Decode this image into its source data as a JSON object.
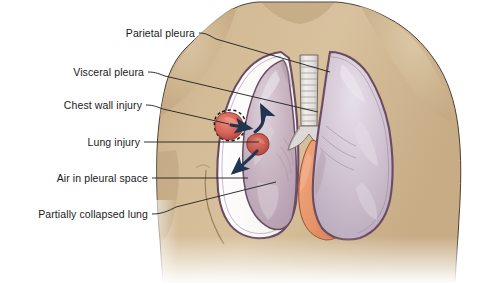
{
  "illustration": {
    "title": "Pneumothorax - partially collapsed lung with chest wall and lung injury",
    "canvas": {
      "width": 493,
      "height": 284
    },
    "background_color": "#ffffff",
    "colors": {
      "skin": "#cfb68f",
      "skin_shadow": "#b59b74",
      "skin_highlight": "#ddc8a6",
      "pleura_outline": "#6b4c63",
      "lung_tissue": "#cbbccb",
      "lung_tissue_light": "#e5dde6",
      "collapsed_lung": "#c4aebb",
      "air_space": "#fdfcfb",
      "heart": "#e8956b",
      "heart_shadow": "#d87f55",
      "trachea": "#e9e6e4",
      "trachea_ring": "#b8b0ac",
      "wound_red": "#d9665a",
      "wound_red_dark": "#a8362e",
      "arrow_navy": "#1f3550",
      "leader_line": "#262626",
      "label_text": "#1a1a1a"
    }
  },
  "labels": [
    {
      "id": "parietal-pleura",
      "text": "Parietal pleura",
      "text_anchor_x": 195,
      "text_anchor_y": 33,
      "leader": "M 199 33 C 207 33 210 36 216 39 L 330 72"
    },
    {
      "id": "visceral-pleura",
      "text": "Visceral pleura",
      "text_anchor_x": 144,
      "text_anchor_y": 72,
      "leader": "M 148 72 C 156 72 159 74 165 76 L 318 112"
    },
    {
      "id": "chest-wall-injury",
      "text": "Chest wall injury",
      "text_anchor_x": 142,
      "text_anchor_y": 105,
      "leader": "M 146 105 C 154 105 157 107 163 109 L 229 124"
    },
    {
      "id": "lung-injury",
      "text": "Lung injury",
      "text_anchor_x": 140,
      "text_anchor_y": 142,
      "leader": "M 144 142 L 259 142"
    },
    {
      "id": "air-in-pleural-space",
      "text": "Air in pleural space",
      "text_anchor_x": 148,
      "text_anchor_y": 178,
      "leader": "M 152 178 L 248 178"
    },
    {
      "id": "partially-collapsed-lung",
      "text": "Partially collapsed lung",
      "text_anchor_x": 148,
      "text_anchor_y": 214,
      "leader": "M 152 214 C 162 214 168 211 176 207 L 276 182"
    }
  ],
  "anatomy": {
    "torso": {
      "name": "upper torso and shoulders",
      "fill": "#cfb68f"
    },
    "left_pleural_cavity": {
      "name": "pneumothorax cavity with free air",
      "fill": "#fdfcfb"
    },
    "left_lung": {
      "name": "partially collapsed left lung",
      "fill": "#c4aebb"
    },
    "right_lung": {
      "name": "normally inflated right lung",
      "fill": "#cbbccb"
    },
    "heart": {
      "name": "heart",
      "fill": "#e8956b"
    },
    "trachea": {
      "name": "trachea with cartilage rings",
      "fill": "#e9e6e4",
      "ring_count": 11
    },
    "chest_wall_wound": {
      "name": "penetrating chest wall injury",
      "fill": "#d9665a"
    },
    "lung_wound": {
      "name": "lung laceration",
      "fill": "#c2584e"
    }
  },
  "arrows": [
    {
      "id": "air-entering-straight",
      "description": "air entering pleural space through chest wall",
      "path": "M 233 124 L 254 128",
      "color": "#1f3550"
    },
    {
      "id": "air-upward-curve",
      "description": "air moving superiorly in pleural space",
      "path": "M 256 134 C 264 128 265 116 261 108",
      "color": "#1f3550"
    },
    {
      "id": "air-downward-curve",
      "description": "air moving inferiorly from lung injury",
      "path": "M 258 150 C 250 158 240 166 232 172",
      "color": "#1f3550"
    }
  ]
}
